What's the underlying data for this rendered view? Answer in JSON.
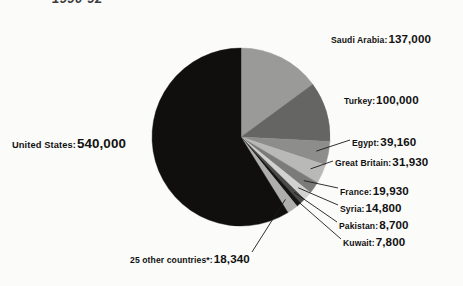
{
  "title": "1990-92",
  "colors": {
    "background": "#fbfbfa",
    "text": "#111111",
    "leader_line": "#1a1a1a",
    "slice_united_states": "#100f0e",
    "slice_saudi_arabia": "#9a9a99",
    "slice_turkey": "#656564",
    "slice_egypt": "#8d8d8c",
    "slice_great_britain": "#b9b9b7",
    "slice_france": "#7b7b7a",
    "slice_syria": "#d2d2d0",
    "slice_pakistan": "#4a4a49",
    "slice_kuwait": "#151514",
    "slice_other": "#aeaeac"
  },
  "labels": {
    "saudi_arabia": {
      "name": "Saudi Arabia:",
      "value": "137,000"
    },
    "turkey": {
      "name": "Turkey:",
      "value": "100,000"
    },
    "egypt": {
      "name": "Egypt:",
      "value": "39,160"
    },
    "great_britain": {
      "name": "Great Britain:",
      "value": "31,930"
    },
    "france": {
      "name": "France:",
      "value": "19,930"
    },
    "syria": {
      "name": "Syria:",
      "value": "14,800"
    },
    "pakistan": {
      "name": "Pakistan:",
      "value": "8,700"
    },
    "kuwait": {
      "name": "Kuwait:",
      "value": "7,800"
    },
    "united_states": {
      "name": "United States:",
      "value": "540,000"
    },
    "other": {
      "name": "25 other countries*:",
      "value": "18,340"
    }
  },
  "chart_data": {
    "type": "pie",
    "title": "1990-92",
    "legend_position": "callout-labels",
    "grid": false,
    "total": 918660,
    "start_angle_deg": 0,
    "direction": "clockwise",
    "categories": [
      "Saudi Arabia",
      "Turkey",
      "Egypt",
      "Great Britain",
      "France",
      "Syria",
      "Pakistan",
      "Kuwait",
      "25 other countries*",
      "United States"
    ],
    "values": [
      137000,
      100000,
      39160,
      31930,
      19930,
      14800,
      8700,
      7800,
      18340,
      540000
    ],
    "value_labels": [
      "137,000",
      "100,000",
      "39,160",
      "31,930",
      "19,930",
      "14,800",
      "8,700",
      "7,800",
      "18,340",
      "540,000"
    ],
    "slice_colors": [
      "#9a9a99",
      "#656564",
      "#8d8d8c",
      "#b9b9b7",
      "#7b7b7a",
      "#d2d2d0",
      "#4a4a49",
      "#151514",
      "#aeaeac",
      "#100f0e"
    ],
    "xlabel": "",
    "ylabel": ""
  },
  "geometry": {
    "center_x": 241,
    "center_y": 137,
    "radius": 89
  }
}
